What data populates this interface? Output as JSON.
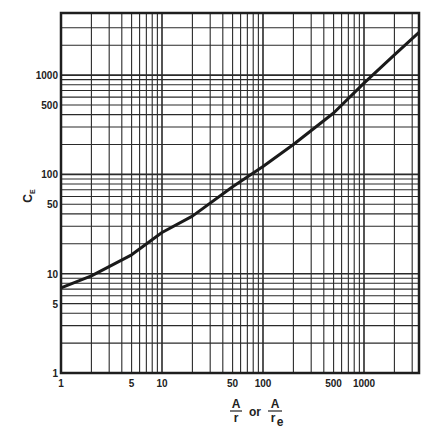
{
  "chart_data": {
    "type": "line",
    "title": "",
    "xlabel": "A/r or A/r_e",
    "xlabel_parts": {
      "num1": "A",
      "den1": "r",
      "or": "or",
      "num2": "A",
      "den2": "r",
      "den2_sub": "e"
    },
    "ylabel": "C_E",
    "ylabel_parts": {
      "main": "C",
      "sub": "E"
    },
    "xscale": "log",
    "yscale": "log",
    "xlim": [
      1,
      3500
    ],
    "ylim": [
      1,
      4000
    ],
    "grid": true,
    "legend": null,
    "x_ticks": [
      {
        "value": 1,
        "label": "1"
      },
      {
        "value": 5,
        "label": "5"
      },
      {
        "value": 10,
        "label": "10"
      },
      {
        "value": 50,
        "label": "50"
      },
      {
        "value": 100,
        "label": "100"
      },
      {
        "value": 500,
        "label": "500"
      },
      {
        "value": 1000,
        "label": "1000"
      }
    ],
    "y_ticks": [
      {
        "value": 1,
        "label": "1"
      },
      {
        "value": 5,
        "label": "5"
      },
      {
        "value": 10,
        "label": "10"
      },
      {
        "value": 50,
        "label": "50"
      },
      {
        "value": 100,
        "label": "100"
      },
      {
        "value": 500,
        "label": "500"
      },
      {
        "value": 1000,
        "label": "1000"
      }
    ],
    "series": [
      {
        "name": "C_E",
        "x": [
          1,
          2,
          5,
          10,
          20,
          50,
          100,
          200,
          500,
          1000,
          2000,
          3500
        ],
        "y": [
          7.2,
          9.5,
          15.5,
          26,
          38,
          75,
          120,
          200,
          415,
          830,
          1600,
          2700
        ]
      }
    ]
  }
}
